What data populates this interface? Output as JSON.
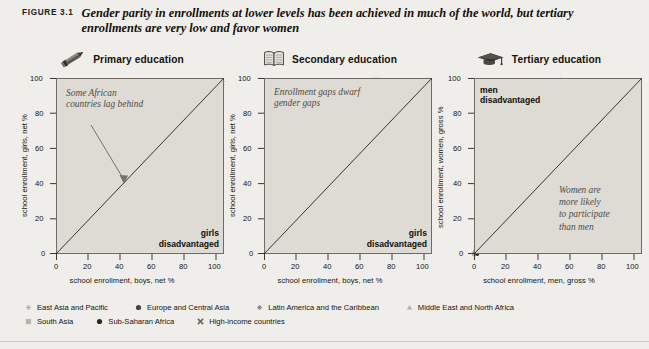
{
  "figure": {
    "label": "FIGURE 3.1",
    "caption": "Gender parity in enrollments at lower levels has been achieved in much of the world, but tertiary enrollments are very low and favor women"
  },
  "legend": {
    "rows": [
      [
        {
          "marker": "plus-marker",
          "label": "East Asia and Pacific",
          "color": "#b9b4ab"
        },
        {
          "marker": "filled-circle-marker",
          "label": "Europe and Central Asia",
          "color": "#4a4741"
        },
        {
          "marker": "diamond-marker",
          "label": "Latin America and the Caribbean",
          "color": "#8e8a82"
        },
        {
          "marker": "triangle-marker",
          "label": "Middle East and North Africa",
          "color": "#b3aea5"
        }
      ],
      [
        {
          "marker": "square-marker",
          "label": "South Asia",
          "color": "#b9b4ab"
        },
        {
          "marker": "filled-circle-marker",
          "label": "Sub-Saharan Africa",
          "color": "#2b2924"
        },
        {
          "marker": "cross-marker",
          "label": "High-income countries",
          "color": "#6d6961"
        }
      ]
    ]
  },
  "chart_data": [
    {
      "type": "scatter",
      "panel_id": "primary",
      "title": "Primary education",
      "icon": "pencil-icon",
      "xlabel": "school enrollment, boys, net %",
      "ylabel": "school enrollment, girls, net %",
      "xlim": [
        0,
        105
      ],
      "ylim": [
        0,
        105
      ],
      "xticks": [
        0,
        20,
        40,
        60,
        80,
        100
      ],
      "yticks": [
        0,
        20,
        40,
        60,
        80,
        100
      ],
      "grid": false,
      "reference_line": {
        "type": "45-degree parity line",
        "from": [
          0,
          0
        ],
        "to": [
          105,
          105
        ]
      },
      "annotation": "Some African\ncountries lag behind",
      "corner_label": "girls\ndisadvantaged",
      "points": [
        [
          41,
          36
        ],
        [
          44,
          39
        ],
        [
          57,
          44
        ],
        [
          66,
          58
        ],
        [
          67,
          59
        ],
        [
          67,
          60
        ],
        [
          68,
          60
        ],
        [
          74,
          66
        ],
        [
          75,
          67
        ],
        [
          76,
          68
        ],
        [
          79,
          58
        ],
        [
          80,
          71
        ],
        [
          81,
          73
        ],
        [
          82,
          74
        ],
        [
          83,
          76
        ],
        [
          84,
          77
        ],
        [
          84,
          79
        ],
        [
          85,
          80
        ],
        [
          85,
          82
        ],
        [
          86,
          83
        ],
        [
          86,
          85
        ],
        [
          87,
          84
        ],
        [
          87,
          86
        ],
        [
          88,
          86
        ],
        [
          88,
          88
        ],
        [
          89,
          87
        ],
        [
          89,
          89
        ],
        [
          90,
          82
        ],
        [
          90,
          88
        ],
        [
          90,
          90
        ],
        [
          91,
          89
        ],
        [
          91,
          91
        ],
        [
          92,
          90
        ],
        [
          92,
          92
        ],
        [
          92,
          80
        ],
        [
          93,
          91
        ],
        [
          93,
          93
        ],
        [
          93,
          85
        ],
        [
          94,
          92
        ],
        [
          94,
          94
        ],
        [
          94,
          87
        ],
        [
          95,
          93
        ],
        [
          95,
          95
        ],
        [
          95,
          89
        ],
        [
          96,
          94
        ],
        [
          96,
          96
        ],
        [
          96,
          91
        ],
        [
          97,
          95
        ],
        [
          97,
          97
        ],
        [
          97,
          93
        ],
        [
          98,
          96
        ],
        [
          98,
          98
        ],
        [
          98,
          94
        ],
        [
          99,
          97
        ],
        [
          99,
          99
        ],
        [
          99,
          95
        ],
        [
          100,
          98
        ],
        [
          100,
          100
        ],
        [
          100,
          96
        ],
        [
          101,
          99
        ],
        [
          101,
          101
        ],
        [
          101,
          97
        ],
        [
          102,
          100
        ],
        [
          102,
          102
        ],
        [
          102,
          98
        ],
        [
          103,
          101
        ],
        [
          103,
          103
        ],
        [
          103,
          99
        ],
        [
          104,
          102
        ],
        [
          104,
          100
        ],
        [
          91,
          90
        ],
        [
          88,
          80
        ],
        [
          86,
          78
        ],
        [
          89,
          80
        ],
        [
          92,
          89
        ],
        [
          93,
          82
        ],
        [
          95,
          90
        ],
        [
          97,
          92
        ],
        [
          99,
          94
        ],
        [
          100,
          90
        ],
        [
          78,
          68
        ],
        [
          77,
          70
        ],
        [
          73,
          66
        ],
        [
          82,
          72
        ],
        [
          84,
          75
        ],
        [
          90,
          81
        ],
        [
          94,
          85
        ],
        [
          96,
          88
        ],
        [
          98,
          91
        ],
        [
          101,
          95
        ]
      ]
    },
    {
      "type": "scatter",
      "panel_id": "secondary",
      "title": "Secondary education",
      "icon": "open-book-icon",
      "xlabel": "school enrollment, boys, net %",
      "ylabel": "school enrollment, girls, net %",
      "xlim": [
        0,
        105
      ],
      "ylim": [
        0,
        105
      ],
      "xticks": [
        0,
        20,
        40,
        60,
        80,
        100
      ],
      "yticks": [
        0,
        20,
        40,
        60,
        80,
        100
      ],
      "grid": false,
      "reference_line": {
        "type": "45-degree parity line",
        "from": [
          0,
          0
        ],
        "to": [
          105,
          105
        ]
      },
      "annotation": "Enrollment gaps dwarf\ngender gaps",
      "corner_label": "girls\ndisadvantaged",
      "points": [
        [
          5,
          4
        ],
        [
          6,
          5
        ],
        [
          9,
          6
        ],
        [
          10,
          6
        ],
        [
          11,
          6
        ],
        [
          14,
          12
        ],
        [
          16,
          14
        ],
        [
          18,
          31
        ],
        [
          19,
          16
        ],
        [
          20,
          18
        ],
        [
          22,
          22
        ],
        [
          23,
          23
        ],
        [
          24,
          24
        ],
        [
          25,
          23
        ],
        [
          26,
          22
        ],
        [
          27,
          22
        ],
        [
          28,
          21
        ],
        [
          29,
          21
        ],
        [
          30,
          23
        ],
        [
          31,
          25
        ],
        [
          32,
          26
        ],
        [
          33,
          20
        ],
        [
          34,
          20
        ],
        [
          35,
          21
        ],
        [
          36,
          21
        ],
        [
          37,
          27
        ],
        [
          38,
          30
        ],
        [
          39,
          41
        ],
        [
          40,
          42
        ],
        [
          41,
          35
        ],
        [
          42,
          34
        ],
        [
          43,
          36
        ],
        [
          44,
          48
        ],
        [
          45,
          47
        ],
        [
          46,
          44
        ],
        [
          47,
          51
        ],
        [
          48,
          50
        ],
        [
          49,
          62
        ],
        [
          50,
          50
        ],
        [
          51,
          38
        ],
        [
          52,
          40
        ],
        [
          54,
          58
        ],
        [
          56,
          60
        ],
        [
          57,
          65
        ],
        [
          58,
          66
        ],
        [
          60,
          62
        ],
        [
          62,
          68
        ],
        [
          63,
          70
        ],
        [
          64,
          72
        ],
        [
          65,
          73
        ],
        [
          66,
          76
        ],
        [
          67,
          77
        ],
        [
          68,
          78
        ],
        [
          69,
          80
        ],
        [
          70,
          79
        ],
        [
          71,
          75
        ],
        [
          72,
          74
        ],
        [
          73,
          76
        ],
        [
          74,
          78
        ],
        [
          75,
          80
        ],
        [
          76,
          81
        ],
        [
          78,
          73
        ],
        [
          80,
          82
        ],
        [
          82,
          84
        ],
        [
          83,
          86
        ],
        [
          84,
          85
        ],
        [
          85,
          88
        ],
        [
          86,
          90
        ],
        [
          87,
          86
        ],
        [
          88,
          92
        ],
        [
          89,
          94
        ],
        [
          90,
          88
        ],
        [
          91,
          80
        ],
        [
          92,
          95
        ],
        [
          93,
          96
        ],
        [
          94,
          92
        ],
        [
          95,
          97
        ],
        [
          96,
          90
        ],
        [
          97,
          98
        ],
        [
          98,
          99
        ],
        [
          99,
          100
        ],
        [
          100,
          101
        ],
        [
          101,
          102
        ],
        [
          102,
          103
        ],
        [
          103,
          104
        ],
        [
          70,
          104
        ],
        [
          52,
          44
        ],
        [
          48,
          38
        ],
        [
          30,
          28
        ],
        [
          26,
          26
        ],
        [
          21,
          19
        ],
        [
          17,
          15
        ],
        [
          13,
          10
        ],
        [
          12,
          8
        ],
        [
          36,
          29
        ],
        [
          44,
          40
        ],
        [
          59,
          57
        ],
        [
          77,
          72
        ],
        [
          81,
          83
        ],
        [
          88,
          87
        ]
      ]
    },
    {
      "type": "scatter",
      "panel_id": "tertiary",
      "title": "Tertiary education",
      "icon": "graduation-cap-icon",
      "xlabel": "school enrollment, men, gross %",
      "ylabel": "school enrollment, women, gross %",
      "xlim": [
        0,
        105
      ],
      "ylim": [
        0,
        105
      ],
      "xticks": [
        0,
        20,
        40,
        60,
        80,
        100
      ],
      "yticks": [
        0,
        20,
        40,
        60,
        80,
        100
      ],
      "grid": false,
      "reference_line": {
        "type": "45-degree parity line",
        "from": [
          0,
          0
        ],
        "to": [
          105,
          105
        ]
      },
      "annotation": "Women are\nmore likely\nto participate\nthan men",
      "corner_label": "men\ndisadvantaged",
      "points": [
        [
          0,
          0
        ],
        [
          1,
          1
        ],
        [
          1,
          2
        ],
        [
          2,
          1
        ],
        [
          2,
          3
        ],
        [
          3,
          2
        ],
        [
          3,
          4
        ],
        [
          4,
          3
        ],
        [
          4,
          5
        ],
        [
          5,
          4
        ],
        [
          5,
          6
        ],
        [
          6,
          5
        ],
        [
          6,
          8
        ],
        [
          7,
          6
        ],
        [
          7,
          9
        ],
        [
          8,
          7
        ],
        [
          8,
          12
        ],
        [
          9,
          8
        ],
        [
          9,
          13
        ],
        [
          10,
          9
        ],
        [
          10,
          11
        ],
        [
          11,
          10
        ],
        [
          11,
          14
        ],
        [
          12,
          11
        ],
        [
          12,
          16
        ],
        [
          13,
          12
        ],
        [
          13,
          18
        ],
        [
          14,
          13
        ],
        [
          14,
          22
        ],
        [
          15,
          14
        ],
        [
          15,
          26
        ],
        [
          16,
          16
        ],
        [
          16,
          30
        ],
        [
          17,
          18
        ],
        [
          18,
          20
        ],
        [
          19,
          24
        ],
        [
          20,
          27
        ],
        [
          21,
          29
        ],
        [
          22,
          34
        ],
        [
          23,
          33
        ],
        [
          24,
          38
        ],
        [
          25,
          40
        ],
        [
          26,
          39
        ],
        [
          27,
          46
        ],
        [
          28,
          11
        ],
        [
          28,
          49
        ],
        [
          29,
          30
        ],
        [
          30,
          33
        ],
        [
          31,
          41
        ],
        [
          32,
          36
        ],
        [
          33,
          44
        ],
        [
          34,
          46
        ],
        [
          35,
          48
        ],
        [
          36,
          40
        ],
        [
          37,
          57
        ],
        [
          38,
          39
        ],
        [
          39,
          43
        ],
        [
          40,
          60
        ],
        [
          41,
          55
        ],
        [
          42,
          62
        ],
        [
          43,
          35
        ],
        [
          44,
          66
        ],
        [
          45,
          50
        ],
        [
          46,
          64
        ],
        [
          47,
          68
        ],
        [
          48,
          72
        ],
        [
          49,
          70
        ],
        [
          50,
          52
        ],
        [
          51,
          88
        ],
        [
          52,
          86
        ],
        [
          52,
          100
        ],
        [
          53,
          66
        ],
        [
          54,
          80
        ],
        [
          54,
          104
        ],
        [
          55,
          67
        ],
        [
          56,
          92
        ],
        [
          57,
          103
        ],
        [
          58,
          96
        ],
        [
          59,
          88
        ],
        [
          60,
          82
        ],
        [
          60,
          101
        ],
        [
          61,
          100
        ],
        [
          62,
          56
        ],
        [
          63,
          100
        ],
        [
          64,
          91
        ],
        [
          65,
          100
        ],
        [
          66,
          100
        ],
        [
          68,
          92
        ],
        [
          70,
          95
        ],
        [
          71,
          101
        ],
        [
          72,
          90
        ],
        [
          74,
          91
        ],
        [
          90,
          100
        ],
        [
          2,
          0
        ],
        [
          4,
          2
        ],
        [
          6,
          4
        ],
        [
          8,
          6
        ],
        [
          10,
          8
        ],
        [
          12,
          10
        ],
        [
          14,
          12
        ]
      ]
    }
  ]
}
